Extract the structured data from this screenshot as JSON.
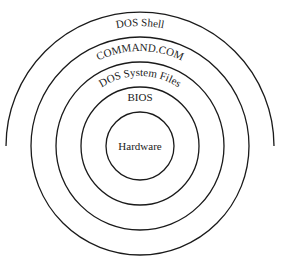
{
  "diagram": {
    "type": "concentric-layers",
    "center": {
      "x": 140,
      "y": 146
    },
    "layers": [
      {
        "label": "Hardware",
        "radius": 34,
        "shape": "circle"
      },
      {
        "label": "BIOS",
        "radius": 59,
        "shape": "circle"
      },
      {
        "label": "DOS System Files",
        "radius": 84,
        "shape": "circle"
      },
      {
        "label": "COMMAND.COM",
        "radius": 109,
        "shape": "circle"
      },
      {
        "label": "DOS Shell",
        "radius": 134,
        "shape": "semicircle-top"
      }
    ],
    "stroke_color": "#1a1a1a",
    "background": "#ffffff"
  }
}
